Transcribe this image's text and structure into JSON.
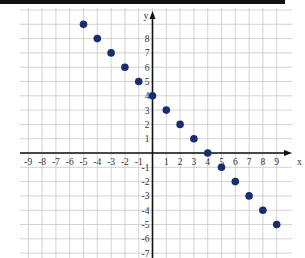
{
  "chart_data": {
    "type": "scatter",
    "title": "",
    "xlabel": "x",
    "ylabel": "y",
    "xlim": [
      -9,
      9
    ],
    "ylim": [
      -7,
      9
    ],
    "grid": true,
    "x_tick_labels": [
      "-9",
      "-8",
      "-7",
      "-6",
      "-5",
      "-4",
      "-3",
      "-2",
      "-1",
      "1",
      "2",
      "3",
      "4",
      "5",
      "6",
      "7",
      "8",
      "9"
    ],
    "y_tick_labels": [
      "8",
      "7",
      "6",
      "5",
      "4",
      "3",
      "2",
      "1",
      "-1",
      "-2",
      "-3",
      "-4",
      "-5",
      "-6",
      "-7"
    ],
    "series": [
      {
        "name": "points",
        "color": "#1a2e6e",
        "points": [
          [
            -5,
            9
          ],
          [
            -4,
            8
          ],
          [
            -3,
            7
          ],
          [
            -2,
            6
          ],
          [
            -1,
            5
          ],
          [
            0,
            4
          ],
          [
            1,
            3
          ],
          [
            2,
            2
          ],
          [
            3,
            1
          ],
          [
            4,
            0
          ],
          [
            5,
            -1
          ],
          [
            6,
            -2
          ],
          [
            7,
            -3
          ],
          [
            8,
            -4
          ],
          [
            9,
            -5
          ]
        ]
      }
    ]
  },
  "style": {
    "grid_color": "#c8c8c8",
    "axis_color": "#111111",
    "point_color": "#1a2e6e"
  }
}
